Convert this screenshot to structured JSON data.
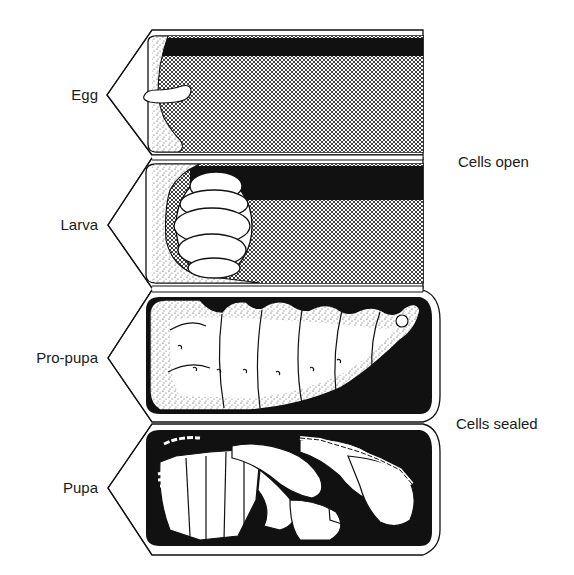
{
  "figure": {
    "colors": {
      "ink": "#111111",
      "paper": "#ffffff",
      "hatch": "#3a3a3a"
    },
    "stages": [
      {
        "id": "egg",
        "label": "Egg",
        "cell_state": "open",
        "content": "egg"
      },
      {
        "id": "larva",
        "label": "Larva",
        "cell_state": "open",
        "content": "larva"
      },
      {
        "id": "pro-pupa",
        "label": "Pro-pupa",
        "cell_state": "sealed",
        "content": "pro-pupa"
      },
      {
        "id": "pupa",
        "label": "Pupa",
        "cell_state": "sealed",
        "content": "pupa"
      }
    ],
    "groups": [
      {
        "id": "open",
        "label": "Cells open"
      },
      {
        "id": "sealed",
        "label": "Cells sealed"
      }
    ]
  }
}
